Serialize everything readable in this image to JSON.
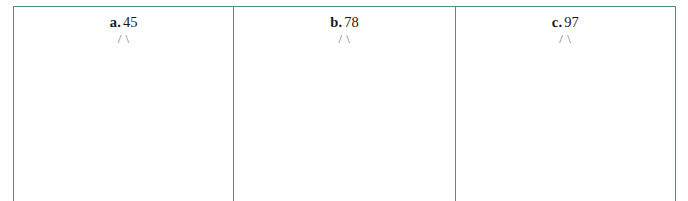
{
  "worksheet": {
    "colors": {
      "rule": "#4e9470",
      "ink": "#1a1a1a",
      "ink_faint": "#707070",
      "page_background": "#ffffff"
    },
    "cells": [
      {
        "label": "a.",
        "number": "45",
        "branch": "/ \\"
      },
      {
        "label": "b.",
        "number": "78",
        "branch": "/ \\"
      },
      {
        "label": "c.",
        "number": "97",
        "branch": "/ \\"
      }
    ]
  }
}
